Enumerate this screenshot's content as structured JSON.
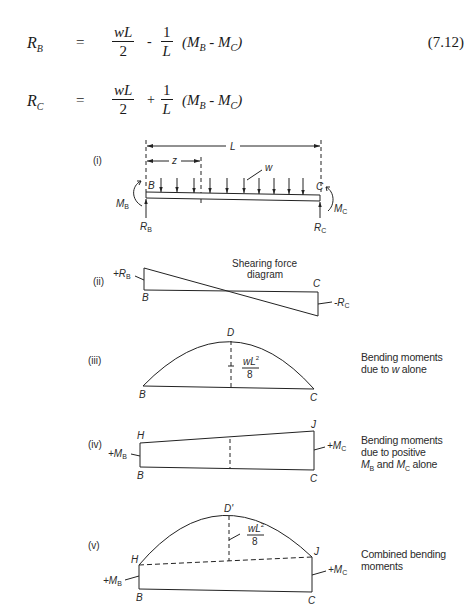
{
  "equations": [
    {
      "lhs": "R",
      "lhs_sub": "B",
      "equals": "=",
      "frac1_num": "wL",
      "frac1_den": "2",
      "operator": "-",
      "frac2_num": "1",
      "frac2_den": "L",
      "paren_open": "(M",
      "paren_sub1": "B",
      "paren_mid": " - M",
      "paren_sub2": "C",
      "paren_close": ")",
      "number": "(7.12)"
    },
    {
      "lhs": "R",
      "lhs_sub": "C",
      "equals": "=",
      "frac1_num": "wL",
      "frac1_den": "2",
      "operator": "+",
      "frac2_num": "1",
      "frac2_den": "L",
      "paren_open": "(M",
      "paren_sub1": "B",
      "paren_mid": " - M",
      "paren_sub2": "C",
      "paren_close": ")",
      "number": ""
    }
  ],
  "diagram": {
    "panel_i": {
      "roman": "(i)",
      "span_label": "L",
      "z_label": "z",
      "load_label": "w",
      "left_end": "B",
      "right_end": "C",
      "left_moment": "M",
      "left_moment_sub": "B",
      "right_moment": "M",
      "right_moment_sub": "C",
      "left_reaction": "R",
      "left_reaction_sub": "B",
      "right_reaction": "R",
      "right_reaction_sub": "C"
    },
    "panel_ii": {
      "roman": "(ii)",
      "title_line1": "Shearing force",
      "title_line2": "diagram",
      "left_value": "+R",
      "left_value_sub": "B",
      "right_value": "-R",
      "right_value_sub": "C",
      "left_end": "B",
      "right_end": "C"
    },
    "panel_iii": {
      "roman": "(iii)",
      "peak": "D",
      "peak_num": "wL",
      "peak_exp": "2",
      "peak_den": "8",
      "left_end": "B",
      "right_end": "C",
      "note_line1": "Bending moments",
      "note_line2_pre": "due to ",
      "note_line2_var": "w",
      "note_line2_post": " alone"
    },
    "panel_iv": {
      "roman": "(iv)",
      "left_top": "H",
      "right_top": "J",
      "left_end": "B",
      "right_end": "C",
      "left_value": "+M",
      "left_value_sub": "B",
      "right_value": "+M",
      "right_value_sub": "C",
      "note_line1": "Bending moments",
      "note_line2": "due to positive",
      "note_line3_m1": "M",
      "note_line3_s1": "B",
      "note_line3_and": " and ",
      "note_line3_m2": "M",
      "note_line3_s2": "C",
      "note_line3_post": " alone"
    },
    "panel_v": {
      "roman": "(v)",
      "peak": "D'",
      "peak_num": "wL",
      "peak_exp": "2",
      "peak_den": "8",
      "left_top": "H",
      "right_top": "J",
      "left_end": "B",
      "right_end": "C",
      "left_value": "+M",
      "left_value_sub": "B",
      "right_value": "+M",
      "right_value_sub": "C",
      "note_line1": "Combined bending",
      "note_line2": "moments"
    }
  }
}
